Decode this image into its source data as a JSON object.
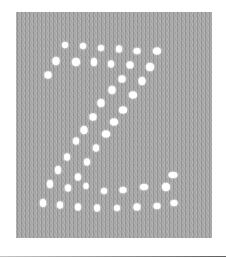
{
  "image": {
    "subject": "knitted stockinette swatch with eyelet lace letter Z",
    "letter": "Z",
    "colors": {
      "background": "#ffffff",
      "fabric": "#a8a8a8",
      "eyelet": "#ffffff",
      "rule": "#7a7a7a"
    },
    "swatch_box": {
      "left": 16,
      "top": 12,
      "width": 196,
      "height": 226
    },
    "eyelets": [
      {
        "x": 65,
        "y": 45,
        "w": 6,
        "h": 6
      },
      {
        "x": 83,
        "y": 46,
        "w": 6,
        "h": 6
      },
      {
        "x": 101,
        "y": 48,
        "w": 6,
        "h": 6
      },
      {
        "x": 119,
        "y": 49,
        "w": 6,
        "h": 7
      },
      {
        "x": 137,
        "y": 51,
        "w": 7,
        "h": 6
      },
      {
        "x": 157,
        "y": 51,
        "w": 8,
        "h": 7
      },
      {
        "x": 56,
        "y": 61,
        "w": 7,
        "h": 8
      },
      {
        "x": 76,
        "y": 62,
        "w": 8,
        "h": 8
      },
      {
        "x": 94,
        "y": 62,
        "w": 6,
        "h": 8
      },
      {
        "x": 111,
        "y": 64,
        "w": 6,
        "h": 7
      },
      {
        "x": 130,
        "y": 65,
        "w": 7,
        "h": 7
      },
      {
        "x": 150,
        "y": 67,
        "w": 8,
        "h": 8
      },
      {
        "x": 48,
        "y": 75,
        "w": 7,
        "h": 7
      },
      {
        "x": 122,
        "y": 79,
        "w": 7,
        "h": 7
      },
      {
        "x": 142,
        "y": 81,
        "w": 7,
        "h": 8
      },
      {
        "x": 112,
        "y": 90,
        "w": 7,
        "h": 8
      },
      {
        "x": 133,
        "y": 95,
        "w": 8,
        "h": 7
      },
      {
        "x": 101,
        "y": 103,
        "w": 7,
        "h": 8
      },
      {
        "x": 123,
        "y": 110,
        "w": 8,
        "h": 7
      },
      {
        "x": 93,
        "y": 117,
        "w": 7,
        "h": 7
      },
      {
        "x": 114,
        "y": 122,
        "w": 8,
        "h": 7
      },
      {
        "x": 84,
        "y": 130,
        "w": 7,
        "h": 8
      },
      {
        "x": 106,
        "y": 134,
        "w": 8,
        "h": 7
      },
      {
        "x": 76,
        "y": 141,
        "w": 6,
        "h": 7
      },
      {
        "x": 96,
        "y": 148,
        "w": 6,
        "h": 7
      },
      {
        "x": 67,
        "y": 157,
        "w": 6,
        "h": 7
      },
      {
        "x": 87,
        "y": 162,
        "w": 6,
        "h": 7
      },
      {
        "x": 58,
        "y": 170,
        "w": 6,
        "h": 8
      },
      {
        "x": 78,
        "y": 177,
        "w": 6,
        "h": 7
      },
      {
        "x": 50,
        "y": 184,
        "w": 6,
        "h": 8
      },
      {
        "x": 68,
        "y": 188,
        "w": 6,
        "h": 7
      },
      {
        "x": 86,
        "y": 186,
        "w": 5,
        "h": 6
      },
      {
        "x": 104,
        "y": 191,
        "w": 6,
        "h": 6
      },
      {
        "x": 123,
        "y": 190,
        "w": 7,
        "h": 6
      },
      {
        "x": 144,
        "y": 187,
        "w": 8,
        "h": 6
      },
      {
        "x": 166,
        "y": 187,
        "w": 8,
        "h": 8
      },
      {
        "x": 173,
        "y": 175,
        "w": 9,
        "h": 6
      },
      {
        "x": 43,
        "y": 203,
        "w": 6,
        "h": 8
      },
      {
        "x": 60,
        "y": 205,
        "w": 6,
        "h": 7
      },
      {
        "x": 78,
        "y": 207,
        "w": 6,
        "h": 7
      },
      {
        "x": 97,
        "y": 208,
        "w": 6,
        "h": 7
      },
      {
        "x": 117,
        "y": 208,
        "w": 6,
        "h": 6
      },
      {
        "x": 137,
        "y": 207,
        "w": 7,
        "h": 7
      },
      {
        "x": 157,
        "y": 206,
        "w": 7,
        "h": 6
      },
      {
        "x": 174,
        "y": 203,
        "w": 7,
        "h": 6
      }
    ]
  }
}
